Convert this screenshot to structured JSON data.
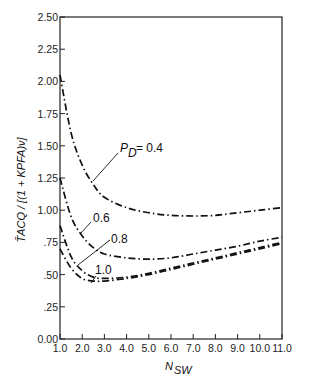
{
  "chart_data": {
    "type": "line",
    "title": "",
    "xlabel": "N_SW",
    "ylabel": "T̄_ACQ / [(1 + KP_FA)^ν]",
    "xlim": [
      1.0,
      11.0
    ],
    "ylim": [
      0.0,
      2.5
    ],
    "grid": false,
    "legend": "inline labels with leader lines",
    "x_ticks": [
      "1.0",
      "2.0",
      "3.0",
      "4.0",
      "5.0",
      "6.0",
      "7.0",
      "8.0",
      "9.0",
      "10.0",
      "11.0"
    ],
    "y_ticks": [
      "0.00",
      ".25",
      ".50",
      ".75",
      "1.00",
      "1.25",
      "1.50",
      "1.75",
      "2.00",
      "2.25",
      "2.50"
    ],
    "x": [
      1.0,
      1.5,
      2.0,
      2.5,
      3.0,
      4.0,
      5.0,
      6.0,
      7.0,
      8.0,
      9.0,
      10.0,
      11.0
    ],
    "series": [
      {
        "name": "P_D = 0.4",
        "label": "P_D = 0.4",
        "values": [
          2.05,
          1.6,
          1.35,
          1.2,
          1.1,
          1.02,
          0.98,
          0.96,
          0.955,
          0.96,
          0.98,
          1.0,
          1.02
        ]
      },
      {
        "name": "0.6",
        "label": "0.6",
        "values": [
          1.25,
          0.95,
          0.8,
          0.71,
          0.66,
          0.63,
          0.62,
          0.63,
          0.66,
          0.69,
          0.72,
          0.76,
          0.79
        ]
      },
      {
        "name": "0.8",
        "label": "0.8",
        "values": [
          0.88,
          0.64,
          0.53,
          0.48,
          0.47,
          0.48,
          0.51,
          0.55,
          0.59,
          0.63,
          0.67,
          0.71,
          0.75
        ]
      },
      {
        "name": "1.0",
        "label": "1.0",
        "values": [
          0.7,
          0.55,
          0.47,
          0.45,
          0.45,
          0.47,
          0.5,
          0.54,
          0.58,
          0.62,
          0.66,
          0.7,
          0.74
        ]
      }
    ],
    "annotations": [
      {
        "text": "P_D = 0.4",
        "series": "P_D = 0.4"
      },
      {
        "text": "0.6",
        "series": "0.6"
      },
      {
        "text": "0.8",
        "series": "0.8"
      },
      {
        "text": "1.0",
        "series": "1.0"
      }
    ]
  },
  "labels": {
    "pd_prefix": "P",
    "pd_sub": "D",
    "pd_value": "= 0.4",
    "l06": "0.6",
    "l08": "0.8",
    "l10": "1.0",
    "x_title_main": "N",
    "x_title_sub": "SW",
    "y_title": "T̄ACQ / [(1 + KPFA)ν]"
  }
}
